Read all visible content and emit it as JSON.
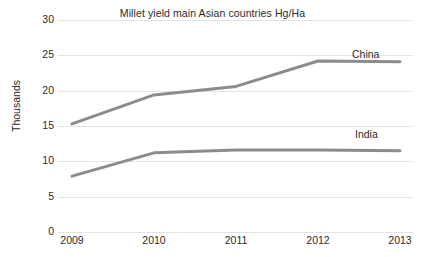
{
  "chart_data": {
    "type": "line",
    "title": "Millet yield main Asian countries Hg/Ha",
    "xlabel": "",
    "ylabel": "Thousands",
    "categories": [
      "2009",
      "2010",
      "2011",
      "2012",
      "2013"
    ],
    "x": [
      2009,
      2010,
      2011,
      2012,
      2013
    ],
    "series": [
      {
        "name": "China",
        "values": [
          15.3,
          19.4,
          20.6,
          24.2,
          24.1
        ],
        "color": "#8c8c8c"
      },
      {
        "name": "India",
        "values": [
          7.9,
          11.2,
          11.6,
          11.6,
          11.5
        ],
        "color": "#8c8c8c"
      }
    ],
    "ylim": [
      0,
      30
    ],
    "yticks": [
      0,
      5,
      10,
      15,
      20,
      25,
      30
    ],
    "ytick_labels": [
      "0",
      "5",
      "10",
      "15",
      "20",
      "25",
      "30"
    ],
    "grid": true,
    "grid_color": "#e3e3e3",
    "legend": "inline-series-labels",
    "background": "#ffffff",
    "line_width": 3
  },
  "axis": {
    "y_title": "Thousands",
    "tick_labels_y": [
      "30",
      "25",
      "20",
      "15",
      "10",
      "5",
      "0"
    ],
    "tick_labels_x": [
      "2009",
      "2010",
      "2011",
      "2012",
      "2013"
    ]
  },
  "labels": {
    "china": "China",
    "india": "India"
  }
}
